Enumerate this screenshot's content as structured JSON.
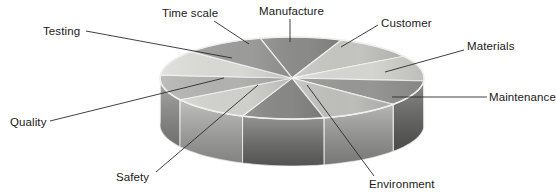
{
  "figure": {
    "type": "3d-pie-diagram",
    "background_color": "#ffffff",
    "label_color": "#1a1a1a",
    "leader_line_color": "#2b2b2b",
    "segment_edge_color": "#f2f2f2"
  },
  "chart_data": {
    "type": "pie",
    "title": "",
    "categories": [
      "Manufacture",
      "Customer",
      "Materials",
      "Maintenance",
      "Environment",
      "Safety",
      "Quality",
      "Testing",
      "Time scale"
    ],
    "values": [
      10,
      10,
      10,
      10,
      10,
      10,
      10,
      10,
      10
    ],
    "units": "%",
    "note": "Ten equal wedges are drawn; nine are labelled.",
    "legend_position": "none",
    "grid": false
  },
  "labels": [
    {
      "id": "testing",
      "text": "Testing",
      "x": 43,
      "y": 25
    },
    {
      "id": "time-scale",
      "text": "Time scale",
      "x": 162,
      "y": 7
    },
    {
      "id": "manufacture",
      "text": "Manufacture",
      "x": 259,
      "y": 5
    },
    {
      "id": "customer",
      "text": "Customer",
      "x": 381,
      "y": 17
    },
    {
      "id": "materials",
      "text": "Materials",
      "x": 467,
      "y": 40
    },
    {
      "id": "maintenance",
      "text": "Maintenance",
      "x": 489,
      "y": 91
    },
    {
      "id": "environment",
      "text": "Environment",
      "x": 369,
      "y": 178
    },
    {
      "id": "safety",
      "text": "Safety",
      "x": 116,
      "y": 171
    },
    {
      "id": "quality",
      "text": "Quality",
      "x": 10,
      "y": 116
    }
  ],
  "geometry": {
    "center_x": 292,
    "center_y": 78,
    "radius_x": 132,
    "radius_y": 41,
    "depth": 47,
    "segment_count": 10
  },
  "palette": {
    "top_light": "#d8d8d6",
    "top_lighter": "#e2e2df",
    "top_mid": "#bcbcba",
    "top_dark": "#8d8d8c",
    "top_darker": "#7d7d7c",
    "side_mid": "#a3a3a1",
    "side_dark": "#6f6f6e",
    "side_darker": "#5e5e5d"
  },
  "segments": [
    {
      "name": "segment-1",
      "top_fill": "#8e8e8d",
      "side_fill": "#6e6e6d"
    },
    {
      "name": "segment-2",
      "top_fill": "#c9c9c6",
      "side_fill": "#9e9e9c"
    },
    {
      "name": "segment-3",
      "top_fill": "#dadad7",
      "side_fill": "#b0b0ae"
    },
    {
      "name": "segment-4",
      "top_fill": "#9a9a99",
      "side_fill": "#5f5f5e"
    },
    {
      "name": "segment-5",
      "top_fill": "#c2c2bf",
      "side_fill": "#9a9a98"
    },
    {
      "name": "segment-6",
      "top_fill": "#8b8b8a",
      "side_fill": "#6a6a69"
    },
    {
      "name": "segment-7",
      "top_fill": "#d5d5d2",
      "side_fill": "#a8a8a6"
    },
    {
      "name": "segment-8",
      "top_fill": "#b6b6b4",
      "side_fill": "#8f8f8d"
    },
    {
      "name": "segment-9",
      "top_fill": "#dedeDB",
      "side_fill": "#aaaaa8"
    },
    {
      "name": "segment-10",
      "top_fill": "#9f9f9e",
      "side_fill": "#757574"
    }
  ],
  "leaders": [
    {
      "id": "leader-testing",
      "x1": 86,
      "y1": 31,
      "x2": 232,
      "y2": 58
    },
    {
      "id": "leader-time-scale",
      "x1": 214,
      "y1": 21,
      "x2": 249,
      "y2": 44
    },
    {
      "id": "leader-manufacture",
      "x1": 290,
      "y1": 19,
      "x2": 290,
      "y2": 42
    },
    {
      "id": "leader-customer",
      "x1": 378,
      "y1": 25,
      "x2": 341,
      "y2": 47
    },
    {
      "id": "leader-materials",
      "x1": 464,
      "y1": 50,
      "x2": 385,
      "y2": 72
    },
    {
      "id": "leader-maintenance",
      "x1": 487,
      "y1": 97,
      "x2": 392,
      "y2": 97
    },
    {
      "id": "leader-environment",
      "x1": 374,
      "y1": 176,
      "x2": 307,
      "y2": 85
    },
    {
      "id": "leader-safety",
      "x1": 156,
      "y1": 172,
      "x2": 258,
      "y2": 85
    },
    {
      "id": "leader-quality",
      "x1": 50,
      "y1": 121,
      "x2": 224,
      "y2": 78
    }
  ]
}
